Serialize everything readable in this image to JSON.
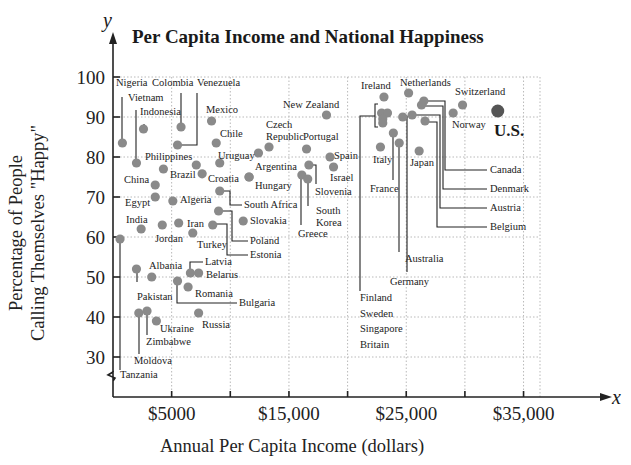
{
  "chart_data": {
    "type": "scatter",
    "title": "Per Capita Income and National Happiness",
    "xlabel": "Annual Per Capita Income (dollars)",
    "ylabel_line1": "Percentage of People",
    "ylabel_line2": "Calling Themselves \"Happy\"",
    "x_axis_var": "x",
    "y_axis_var": "y",
    "xlim": [
      0,
      40000
    ],
    "ylim": [
      25,
      100
    ],
    "y_axis_break": true,
    "grid": true,
    "x_ticks": [
      5000,
      10000,
      15000,
      20000,
      25000,
      30000,
      35000
    ],
    "x_tick_labels": [
      {
        "value": 5000,
        "label": "$5000"
      },
      {
        "value": 15000,
        "label": "$15,000"
      },
      {
        "value": 25000,
        "label": "$25,000"
      },
      {
        "value": 35000,
        "label": "$35,000"
      }
    ],
    "y_ticks": [
      30,
      40,
      50,
      60,
      70,
      80,
      90,
      100
    ],
    "y_tick_labels": [
      "30",
      "40",
      "50",
      "60",
      "70",
      "80",
      "90",
      "100"
    ],
    "highlight": {
      "country": "U.S.",
      "income": 32800,
      "happy": 91.5
    },
    "points": [
      {
        "country": "Nigeria",
        "income": 800,
        "happy": 83.5
      },
      {
        "country": "Vietnam",
        "income": 2000,
        "happy": 78.5
      },
      {
        "country": "Indonesia",
        "income": 2600,
        "happy": 87
      },
      {
        "country": "Colombia",
        "income": 5800,
        "happy": 87.5
      },
      {
        "country": "Venezuela",
        "income": 5500,
        "happy": 83
      },
      {
        "country": "Mexico",
        "income": 8400,
        "happy": 89
      },
      {
        "country": "Chile",
        "income": 8800,
        "happy": 83.5
      },
      {
        "country": "Philippines",
        "income": 4300,
        "happy": 77
      },
      {
        "country": "Brazil",
        "income": 7100,
        "happy": 78
      },
      {
        "country": "Croatia",
        "income": 7600,
        "happy": 75.8
      },
      {
        "country": "",
        "income": 9100,
        "happy": 78.5
      },
      {
        "country": "Uruguay",
        "income": 12400,
        "happy": 81
      },
      {
        "country": "Czech Republic",
        "income": 13300,
        "happy": 82.5
      },
      {
        "country": "Portugal",
        "income": 16500,
        "happy": 82
      },
      {
        "country": "New Zealand",
        "income": 18200,
        "happy": 90.5
      },
      {
        "country": "Spain",
        "income": 18500,
        "happy": 80
      },
      {
        "country": "Israel",
        "income": 18800,
        "happy": 77.5
      },
      {
        "country": "Slovenia",
        "income": 16700,
        "happy": 78
      },
      {
        "country": "Greece",
        "income": 16100,
        "happy": 75.5
      },
      {
        "country": "South Korea",
        "income": 16600,
        "happy": 74.5
      },
      {
        "country": "Argentina",
        "income": 11600,
        "happy": 75
      },
      {
        "country": "Hungary",
        "income": 11600,
        "happy": 75
      },
      {
        "country": "China",
        "income": 3600,
        "happy": 73
      },
      {
        "country": "Egypt",
        "income": 3600,
        "happy": 70
      },
      {
        "country": "Algeria",
        "income": 5100,
        "happy": 69
      },
      {
        "country": "South Africa",
        "income": 9100,
        "happy": 71.5
      },
      {
        "country": "Poland",
        "income": 9000,
        "happy": 66.5
      },
      {
        "country": "Slovakia",
        "income": 11100,
        "happy": 64
      },
      {
        "country": "Estonia",
        "income": 8500,
        "happy": 63
      },
      {
        "country": "Iran",
        "income": 5600,
        "happy": 63.5
      },
      {
        "country": "Jordan",
        "income": 4200,
        "happy": 63
      },
      {
        "country": "India",
        "income": 2400,
        "happy": 62
      },
      {
        "country": "Turkey",
        "income": 6800,
        "happy": 61
      },
      {
        "country": "Tanzania",
        "income": 600,
        "happy": 59.5
      },
      {
        "country": "Pakistan",
        "income": 2000,
        "happy": 52
      },
      {
        "country": "Albania",
        "income": 3300,
        "happy": 50
      },
      {
        "country": "Latvia",
        "income": 6600,
        "happy": 51
      },
      {
        "country": "Belarus",
        "income": 7300,
        "happy": 51
      },
      {
        "country": "Bulgaria",
        "income": 5500,
        "happy": 49
      },
      {
        "country": "Romania",
        "income": 6400,
        "happy": 47.5
      },
      {
        "country": "Moldova",
        "income": 2200,
        "happy": 41
      },
      {
        "country": "Zimbabwe",
        "income": 2900,
        "happy": 41.5
      },
      {
        "country": "Ukraine",
        "income": 3700,
        "happy": 39
      },
      {
        "country": "Russia",
        "income": 7300,
        "happy": 41
      },
      {
        "country": "Ireland",
        "income": 23100,
        "happy": 95
      },
      {
        "country": "Netherlands",
        "income": 25200,
        "happy": 96
      },
      {
        "country": "Switzerland",
        "income": 29800,
        "happy": 93
      },
      {
        "country": "Norway",
        "income": 29000,
        "happy": 91
      },
      {
        "country": "Finland",
        "income": 22900,
        "happy": 91
      },
      {
        "country": "Sweden",
        "income": 23400,
        "happy": 91
      },
      {
        "country": "Singapore",
        "income": 23000,
        "happy": 89.5
      },
      {
        "country": "Britain",
        "income": 23000,
        "happy": 88.5
      },
      {
        "country": "France",
        "income": 23900,
        "happy": 86
      },
      {
        "country": "Australia",
        "income": 24400,
        "happy": 83.5
      },
      {
        "country": "Germany",
        "income": 24700,
        "happy": 90
      },
      {
        "country": "Austria",
        "income": 25500,
        "happy": 90.5
      },
      {
        "country": "Canada",
        "income": 26500,
        "happy": 94
      },
      {
        "country": "Denmark",
        "income": 26300,
        "happy": 93
      },
      {
        "country": "Belgium",
        "income": 26600,
        "happy": 89
      },
      {
        "country": "Italy",
        "income": 22800,
        "happy": 82.5
      },
      {
        "country": "Japan",
        "income": 26100,
        "happy": 81.5
      },
      {
        "country": "U.S.",
        "income": 32800,
        "happy": 91.5
      }
    ]
  },
  "layout": {
    "labels": [
      {
        "text": "Nigeria",
        "x": 116,
        "y": 86
      },
      {
        "text": "Colombia",
        "x": 152,
        "y": 86
      },
      {
        "text": "Venezuela",
        "x": 197,
        "y": 86
      },
      {
        "text": "Vietnam",
        "x": 128,
        "y": 101
      },
      {
        "text": "Indonesia",
        "x": 140,
        "y": 115
      },
      {
        "text": "Mexico",
        "x": 206,
        "y": 113
      },
      {
        "text": "Chile",
        "x": 220,
        "y": 137
      },
      {
        "text": "Czech",
        "x": 266,
        "y": 128
      },
      {
        "text": "Republic",
        "x": 266,
        "y": 140
      },
      {
        "text": "Portugal",
        "x": 303,
        "y": 140
      },
      {
        "text": "New Zealand",
        "x": 283,
        "y": 108
      },
      {
        "text": "Philippines",
        "x": 145,
        "y": 160
      },
      {
        "text": "Uruguay",
        "x": 218,
        "y": 159
      },
      {
        "text": "Spain",
        "x": 334,
        "y": 159
      },
      {
        "text": "Argentina",
        "x": 255,
        "y": 170
      },
      {
        "text": "Brazil",
        "x": 170,
        "y": 178
      },
      {
        "text": "Croatia",
        "x": 208,
        "y": 182
      },
      {
        "text": "China",
        "x": 124,
        "y": 183
      },
      {
        "text": "Hungary",
        "x": 255,
        "y": 189
      },
      {
        "text": "Israel",
        "x": 330,
        "y": 181
      },
      {
        "text": "Slovenia",
        "x": 315,
        "y": 195
      },
      {
        "text": "Egypt",
        "x": 125,
        "y": 206
      },
      {
        "text": "Algeria",
        "x": 180,
        "y": 203
      },
      {
        "text": "South Africa",
        "x": 244,
        "y": 208
      },
      {
        "text": "South",
        "x": 316,
        "y": 214
      },
      {
        "text": "Korea",
        "x": 316,
        "y": 226
      },
      {
        "text": "India",
        "x": 126,
        "y": 223
      },
      {
        "text": "Iran",
        "x": 187,
        "y": 227
      },
      {
        "text": "Slovakia",
        "x": 250,
        "y": 224
      },
      {
        "text": "Greece",
        "x": 298,
        "y": 237
      },
      {
        "text": "Jordan",
        "x": 155,
        "y": 242
      },
      {
        "text": "Poland",
        "x": 250,
        "y": 244
      },
      {
        "text": "Turkey",
        "x": 197,
        "y": 248
      },
      {
        "text": "Estonia",
        "x": 250,
        "y": 258
      },
      {
        "text": "Albania",
        "x": 149,
        "y": 269
      },
      {
        "text": "Latvia",
        "x": 205,
        "y": 265
      },
      {
        "text": "Belarus",
        "x": 206,
        "y": 278
      },
      {
        "text": "Pakistan",
        "x": 137,
        "y": 300
      },
      {
        "text": "Romania",
        "x": 195,
        "y": 297
      },
      {
        "text": "Bulgaria",
        "x": 239,
        "y": 306
      },
      {
        "text": "Ukraine",
        "x": 160,
        "y": 332
      },
      {
        "text": "Russia",
        "x": 202,
        "y": 328
      },
      {
        "text": "Zimbabwe",
        "x": 146,
        "y": 345
      },
      {
        "text": "Moldova",
        "x": 134,
        "y": 364
      },
      {
        "text": "Tanzania",
        "x": 120,
        "y": 378
      },
      {
        "text": "Ireland",
        "x": 361,
        "y": 89
      },
      {
        "text": "Netherlands",
        "x": 400,
        "y": 86
      },
      {
        "text": "Switzerland",
        "x": 455,
        "y": 95
      },
      {
        "text": "Norway",
        "x": 452,
        "y": 128
      },
      {
        "text": "Italy",
        "x": 373,
        "y": 163
      },
      {
        "text": "Japan",
        "x": 410,
        "y": 166
      },
      {
        "text": "France",
        "x": 370,
        "y": 192
      },
      {
        "text": "Canada",
        "x": 490,
        "y": 173
      },
      {
        "text": "Denmark",
        "x": 490,
        "y": 192
      },
      {
        "text": "Austria",
        "x": 490,
        "y": 211
      },
      {
        "text": "Belgium",
        "x": 490,
        "y": 230
      },
      {
        "text": "Australia",
        "x": 405,
        "y": 262
      },
      {
        "text": "Germany",
        "x": 390,
        "y": 285
      },
      {
        "text": "Finland",
        "x": 360,
        "y": 301
      },
      {
        "text": "Sweden",
        "x": 360,
        "y": 317
      },
      {
        "text": "Singapore",
        "x": 360,
        "y": 332
      },
      {
        "text": "Britain",
        "x": 360,
        "y": 348
      }
    ],
    "us_label": {
      "text": "U.S.",
      "x": 494,
      "y": 136
    },
    "leaders": [
      [
        [
          122,
          143
        ],
        [
          122,
          97
        ]
      ],
      [
        [
          136,
          163
        ],
        [
          136,
          110
        ]
      ],
      [
        [
          144,
          128
        ],
        [
          144,
          124
        ]
      ],
      [
        [
          181,
          127
        ],
        [
          181,
          93
        ]
      ],
      [
        [
          178,
          145
        ],
        [
          197,
          145
        ],
        [
          197,
          93
        ]
      ],
      [
        [
          301,
          175
        ],
        [
          301,
          225
        ]
      ],
      [
        [
          308,
          179
        ],
        [
          308,
          206
        ]
      ],
      [
        [
          309,
          165
        ],
        [
          316,
          165
        ],
        [
          316,
          184
        ]
      ],
      [
        [
          220,
          191
        ],
        [
          230,
          191
        ],
        [
          230,
          205
        ],
        [
          242,
          205
        ]
      ],
      [
        [
          218,
          211
        ],
        [
          232,
          211
        ],
        [
          232,
          241
        ],
        [
          248,
          241
        ]
      ],
      [
        [
          213,
          224
        ],
        [
          227,
          224
        ],
        [
          227,
          255
        ],
        [
          248,
          255
        ]
      ],
      [
        [
          120,
          239
        ],
        [
          120,
          370
        ]
      ],
      [
        [
          137,
          268
        ],
        [
          137,
          282
        ]
      ],
      [
        [
          190,
          273
        ],
        [
          190,
          262
        ],
        [
          203,
          262
        ]
      ],
      [
        [
          177,
          282
        ],
        [
          177,
          303
        ],
        [
          237,
          303
        ]
      ],
      [
        [
          139,
          313
        ],
        [
          139,
          354
        ]
      ],
      [
        [
          147,
          311
        ],
        [
          147,
          335
        ]
      ],
      [
        [
          424,
          101
        ],
        [
          445,
          101
        ],
        [
          445,
          170
        ],
        [
          487,
          170
        ]
      ],
      [
        [
          421,
          106
        ],
        [
          443,
          106
        ],
        [
          443,
          189
        ],
        [
          487,
          189
        ]
      ],
      [
        [
          412,
          115
        ],
        [
          440,
          115
        ],
        [
          440,
          208
        ],
        [
          487,
          208
        ]
      ],
      [
        [
          425,
          122
        ],
        [
          437,
          122
        ],
        [
          437,
          227
        ],
        [
          487,
          227
        ]
      ],
      [
        [
          393,
          133
        ],
        [
          393,
          180
        ]
      ],
      [
        [
          399,
          143
        ],
        [
          399,
          252
        ]
      ],
      [
        [
          403,
          116
        ],
        [
          407,
          116
        ],
        [
          407,
          272
        ]
      ],
      [
        [
          378,
          104
        ],
        [
          375,
          104
        ],
        [
          375,
          127
        ],
        [
          378,
          127
        ]
      ],
      [
        [
          375,
          116
        ],
        [
          360,
          116
        ],
        [
          360,
          291
        ]
      ]
    ],
    "plot": {
      "x0": 113,
      "y_axis_px": 397,
      "px_per_1000": 11.73,
      "y100_px": 77,
      "px_per_pct": 4,
      "grid_right": 540,
      "axis_right": 612
    }
  }
}
